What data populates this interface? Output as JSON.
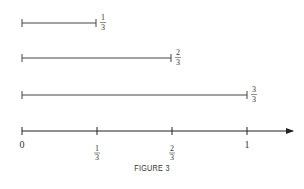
{
  "figure": {
    "caption": "FIGURE 3",
    "segments": [
      {
        "label_num": "1",
        "label_den": "3",
        "value": 0.3333
      },
      {
        "label_num": "2",
        "label_den": "3",
        "value": 0.6667
      },
      {
        "label_num": "3",
        "label_den": "3",
        "value": 1.0
      }
    ],
    "number_line": {
      "ticks": [
        {
          "type": "whole",
          "text": "0"
        },
        {
          "type": "frac",
          "num": "1",
          "den": "3"
        },
        {
          "type": "frac",
          "num": "2",
          "den": "3"
        },
        {
          "type": "whole",
          "text": "1"
        }
      ]
    }
  }
}
